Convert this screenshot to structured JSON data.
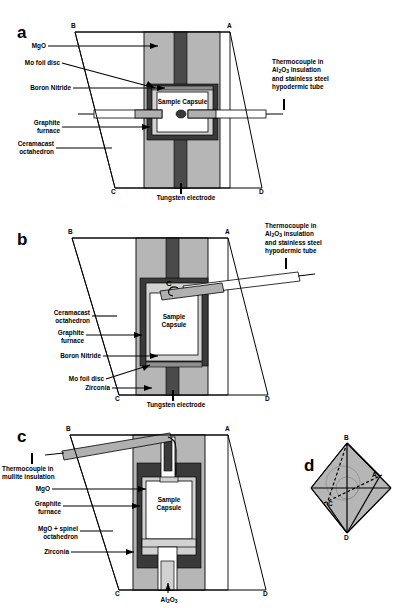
{
  "figure": {
    "type": "multi-panel-technical-diagram",
    "panel_count": 4
  },
  "panels": [
    {
      "letter": "a",
      "vertices": {
        "top_left": "B",
        "top_right": "A",
        "bottom_left": "C",
        "bottom_right": "D"
      },
      "center_text": "Sample\nCapsule",
      "labels_left": [
        {
          "name": "mgo",
          "text": "MgO"
        },
        {
          "name": "mo-foil-disc",
          "text": "Mo foil disc"
        },
        {
          "name": "boron-nitride",
          "text": "Boron Nitride"
        },
        {
          "name": "graphite-furnace",
          "text": "Graphite\nfurnace"
        },
        {
          "name": "ceramacast-octahedron",
          "text": "Ceramacast\noctahedron"
        }
      ],
      "labels_right": [
        {
          "name": "thermocouple-note",
          "text": "Thermocouple in\nAl2O3 insulation\nand stainless steel\nhypodermic tube"
        }
      ],
      "caption_bottom": "Tungsten\nelectrode"
    },
    {
      "letter": "b",
      "vertices": {
        "top_left": "B",
        "top_right": "A",
        "bottom_left": "C",
        "bottom_right": "D"
      },
      "center_text": "Sample\nCapsule",
      "inner_marker": "C",
      "labels_left": [
        {
          "name": "ceramacast-octahedron",
          "text": "Ceramacast\noctahedron"
        },
        {
          "name": "graphite-furnace",
          "text": "Graphite\nfurnace"
        },
        {
          "name": "boron-nitride",
          "text": "Boron Nitride"
        },
        {
          "name": "mo-foil-disc",
          "text": "Mo foil disc"
        },
        {
          "name": "zirconia",
          "text": "Zirconia"
        }
      ],
      "labels_right": [
        {
          "name": "thermocouple-note",
          "text": "Thermocouple in\nAl2O3 insulation\nand stainless steel\nhypodermic tube"
        }
      ],
      "caption_bottom": "Tungsten\nelectrode"
    },
    {
      "letter": "c",
      "vertices": {
        "top_left": "B",
        "top_right": "A",
        "bottom_left": "C",
        "bottom_right": "D"
      },
      "center_text": "Sample\nCapsule",
      "labels_left": [
        {
          "name": "thermocouple-mullite",
          "text": "Thermocouple in\nmullite insulation"
        },
        {
          "name": "mgo",
          "text": "MgO"
        },
        {
          "name": "graphite-furnace",
          "text": "Graphite\nfurnace"
        },
        {
          "name": "mgo-spinel-octahedron",
          "text": "MgO + spinel\noctahedron"
        },
        {
          "name": "zirconia",
          "text": "Zirconia"
        }
      ],
      "caption_bottom": "Al2O3"
    },
    {
      "letter": "d",
      "description": "3D octahedron showing vertices A, B, C, D",
      "vertex_labels": [
        "B",
        "A",
        "C",
        "D"
      ]
    }
  ],
  "subscripts": {
    "al2o3": {
      "base1": "Al",
      "sub1": "2",
      "base2": "O",
      "sub2": "3"
    }
  },
  "colors": {
    "octahedron_gray": "#b6b6b6",
    "graphite_dark": "#3a3a3a",
    "tungsten_dark": "#4a4a4a",
    "boron_nitride_light": "#d2d2d2",
    "capsule_white": "#ffffff",
    "mo_foil_mid": "#8e8e8e",
    "background": "#ffffff",
    "stroke": "#000000"
  }
}
